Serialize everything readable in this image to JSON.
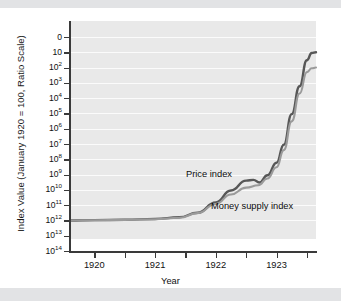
{
  "chart_data": {
    "type": "line",
    "title": "",
    "xlabel": "Year",
    "ylabel": "Index Value (January 1920 = 100, Ratio Scale)",
    "scale": "log",
    "grid": true,
    "legend_position": "inline-annotations",
    "xlim": [
      1919.6,
      1923.65
    ],
    "ylim_exponent": [
      2,
      14
    ],
    "x_ticks_major": [
      1920,
      1921,
      1922,
      1923
    ],
    "x_tick_labels": [
      "1920",
      "1921",
      "1922",
      "1923"
    ],
    "x_ticks_minor": [
      1920.5,
      1921.5,
      1922.5,
      1923.5
    ],
    "y_tick_labels": [
      "0",
      "10",
      "10²",
      "10³",
      "10⁴",
      "10⁵",
      "10⁶",
      "10⁷",
      "10⁸",
      "10⁹",
      "10¹⁰",
      "10¹¹",
      "10¹²",
      "10¹³",
      "10¹⁴"
    ],
    "y_ticks": [
      {
        "mantissa": "0",
        "exp": ""
      },
      {
        "mantissa": "10",
        "exp": ""
      },
      {
        "mantissa": "10",
        "exp": "2"
      },
      {
        "mantissa": "10",
        "exp": "3"
      },
      {
        "mantissa": "10",
        "exp": "4"
      },
      {
        "mantissa": "10",
        "exp": "5"
      },
      {
        "mantissa": "10",
        "exp": "6"
      },
      {
        "mantissa": "10",
        "exp": "7"
      },
      {
        "mantissa": "10",
        "exp": "8"
      },
      {
        "mantissa": "10",
        "exp": "9"
      },
      {
        "mantissa": "10",
        "exp": "10"
      },
      {
        "mantissa": "10",
        "exp": "11"
      },
      {
        "mantissa": "10",
        "exp": "12"
      },
      {
        "mantissa": "10",
        "exp": "13"
      },
      {
        "mantissa": "10",
        "exp": "14"
      }
    ],
    "series": [
      {
        "name": "Price index",
        "color": "#575757",
        "x": [
          1919.6,
          1920.0,
          1920.5,
          1921.0,
          1921.4,
          1921.7,
          1922.0,
          1922.25,
          1922.5,
          1922.62,
          1922.72,
          1922.85,
          1923.0,
          1923.12,
          1923.25,
          1923.38,
          1923.5,
          1923.58,
          1923.65
        ],
        "y": [
          100,
          105,
          110,
          125,
          160,
          320,
          1500,
          9000,
          40000,
          45000,
          30000,
          90000,
          600000,
          9000000,
          900000000,
          60000000000,
          3000000000000,
          9000000000000,
          10000000000000
        ]
      },
      {
        "name": "Money supply index",
        "color": "#9a9a9a",
        "x": [
          1919.6,
          1920.0,
          1920.5,
          1921.0,
          1921.4,
          1921.7,
          1922.0,
          1922.25,
          1922.5,
          1922.7,
          1922.85,
          1923.0,
          1923.12,
          1923.25,
          1923.38,
          1923.5,
          1923.58,
          1923.65
        ],
        "y": [
          100,
          103,
          108,
          120,
          150,
          300,
          1200,
          5000,
          14000,
          20000,
          55000,
          300000,
          4000000,
          300000000,
          20000000000,
          500000000000,
          900000000000,
          1000000000000
        ]
      }
    ],
    "annotations": [
      {
        "text": "Price index",
        "name": "price-index-label"
      },
      {
        "text": "Money supply index",
        "name": "money-supply-index-label"
      }
    ]
  }
}
